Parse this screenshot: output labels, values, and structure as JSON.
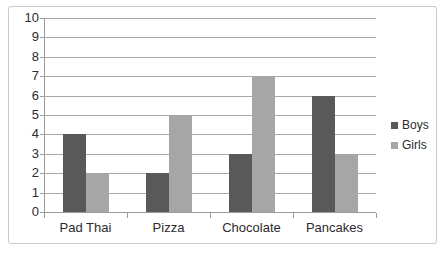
{
  "chart_data": {
    "type": "bar",
    "title": "",
    "xlabel": "",
    "ylabel": "",
    "categories": [
      "Pad Thai",
      "Pizza",
      "Chocolate",
      "Pancakes"
    ],
    "series": [
      {
        "name": "Boys",
        "color": "#595959",
        "values": [
          4,
          2,
          3,
          6
        ]
      },
      {
        "name": "Girls",
        "color": "#a6a6a6",
        "values": [
          2,
          5,
          7,
          3
        ]
      }
    ],
    "ylim": [
      0,
      10
    ],
    "ytick_labels": [
      "10",
      "9",
      "8",
      "7",
      "6",
      "5",
      "4",
      "3",
      "2",
      "1",
      "0"
    ],
    "ytick_values": [
      10,
      9,
      8,
      7,
      6,
      5,
      4,
      3,
      2,
      1,
      0
    ],
    "grid": true,
    "legend_position": "right",
    "legend_entries": [
      "Boys",
      "Girls"
    ]
  }
}
